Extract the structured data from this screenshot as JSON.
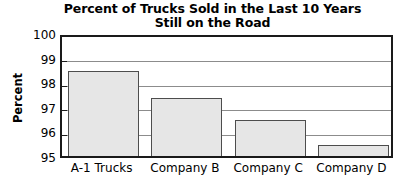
{
  "chart_data": {
    "type": "bar",
    "title": "Percent of Trucks Sold in the Last 10 Years\nStill on the Road",
    "categories": [
      "A-1 Trucks",
      "Company B",
      "Company C",
      "Company D"
    ],
    "values": [
      98.45,
      97.35,
      96.45,
      95.45
    ],
    "xlabel": "",
    "ylabel": "Percent",
    "ylim": [
      95,
      100
    ],
    "yticks": [
      100,
      99,
      98,
      97,
      96,
      95
    ],
    "ytick_labels": [
      "100",
      "99",
      "98",
      "97",
      "96",
      "95"
    ],
    "grid": true,
    "legend": false,
    "series": [
      {
        "name": "Percent still on the road",
        "values": [
          98.45,
          97.35,
          96.45,
          95.45
        ]
      }
    ],
    "colors": {
      "bar_fill": "#e6e6e6",
      "bar_border": "#4d4d4d",
      "axis": "#1a1a1a",
      "gridline": "#8c8c8c",
      "text": "#000000",
      "background": "#ffffff"
    }
  }
}
